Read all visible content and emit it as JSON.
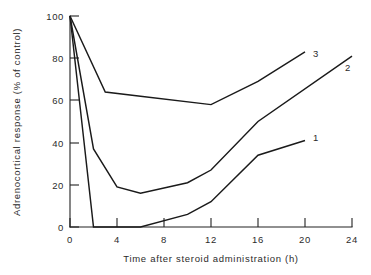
{
  "chart_data": {
    "type": "line",
    "title": "",
    "subtitle": "",
    "xlabel": "Time after steroid administration (h)",
    "ylabel": "Adrenocortical response (% of control)",
    "xlim": [
      0,
      24
    ],
    "ylim": [
      0,
      100
    ],
    "xticks": [
      0,
      4,
      8,
      12,
      16,
      20,
      24
    ],
    "xtick_labels": [
      "0",
      "4",
      "8",
      "12",
      "16",
      "20",
      "24"
    ],
    "yticks": [
      0,
      20,
      40,
      60,
      80,
      100
    ],
    "ytick_labels": [
      "0",
      "20",
      "40",
      "60",
      "80",
      "100"
    ],
    "grid": false,
    "legend_position": "inline-end-of-line",
    "series": [
      {
        "name": "1",
        "label": "1",
        "x": [
          0,
          2,
          6,
          10,
          12,
          16,
          20
        ],
        "values": [
          100,
          0,
          0,
          6,
          12,
          34,
          41
        ]
      },
      {
        "name": "2",
        "label": "2",
        "x": [
          0,
          2,
          4,
          6,
          10,
          12,
          16,
          24
        ],
        "values": [
          100,
          37,
          19,
          16,
          21,
          27,
          50,
          81
        ]
      },
      {
        "name": "3",
        "label": "3",
        "x": [
          0,
          3,
          6,
          12,
          16,
          20
        ],
        "values": [
          100,
          64,
          62,
          58,
          69,
          83
        ]
      }
    ]
  },
  "axes": {
    "y_axis_name": "y-axis",
    "x_axis_name": "x-axis"
  },
  "colors": {
    "line": "#1a1a1a",
    "axis": "#222222",
    "text": "#2b2b2b",
    "background": "#ffffff"
  }
}
